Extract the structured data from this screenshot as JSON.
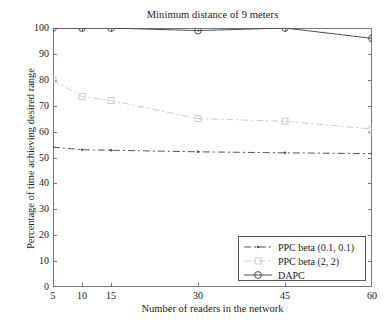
{
  "chart_data": {
    "type": "line",
    "title": "Minimum distance of 9 meters",
    "xlabel": "Number of readers in the network",
    "ylabel": "Percentage of time achieving desired range",
    "x": [
      5,
      10,
      15,
      30,
      45,
      60
    ],
    "xticks": [
      "5",
      "10",
      "15",
      "30",
      "45",
      "60"
    ],
    "yticks": [
      "0",
      "10",
      "20",
      "30",
      "40",
      "50",
      "60",
      "70",
      "80",
      "90",
      "100"
    ],
    "xlim": [
      5,
      60
    ],
    "ylim": [
      0,
      100
    ],
    "grid": false,
    "legend_position": "lower right",
    "series": [
      {
        "name": "PPC beta (0.1, 0.1)",
        "values": [
          54,
          53,
          52.8,
          52.2,
          51.8,
          51.5
        ],
        "color": "#555555",
        "marker": "dot",
        "linestyle": "dash-dot"
      },
      {
        "name": "PPC beta (2, 2)",
        "values": [
          80,
          73.5,
          72,
          65,
          64,
          61
        ],
        "color": "#cccccc",
        "marker": "square",
        "linestyle": "dash-dot"
      },
      {
        "name": "DAPC",
        "values": [
          100,
          100,
          100,
          99,
          100,
          96
        ],
        "color": "#4d4d4d",
        "marker": "circle",
        "linestyle": "solid"
      }
    ]
  },
  "legend": {
    "items": [
      {
        "label": "PPC beta (0.1, 0.1)"
      },
      {
        "label": "PPC beta (2, 2)"
      },
      {
        "label": "DAPC"
      }
    ]
  },
  "axis": {
    "frame_color": "#777777"
  }
}
